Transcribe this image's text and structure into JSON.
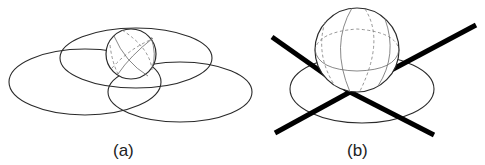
{
  "figure": {
    "panels": [
      {
        "id": "a",
        "label": "(a)",
        "description": "Sphere inside three intersecting ellipses"
      },
      {
        "id": "b",
        "label": "(b)",
        "description": "Sphere resting on an ellipse with two crossing thick lines"
      }
    ],
    "colors": {
      "stroke": "#2a2a2a",
      "thick_line": "#000000",
      "background": "#ffffff"
    }
  }
}
